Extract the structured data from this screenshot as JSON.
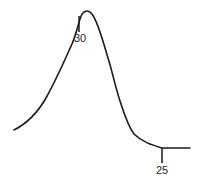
{
  "diagram": {
    "type": "curve-sketch",
    "stroke_color": "#1a1a1a",
    "curve": {
      "description": "Skewed bell-shaped curve with peak at left-center and long tail to the right",
      "path": "M14,130 C26,124 38,112 46,98 C56,80 64,62 72,44 C77,32 79,20 82,14 C85,10 89,10 92,14 C98,22 102,38 108,58 C113,74 116,90 121,104 C125,116 128,126 134,134 C142,142 152,145 162,148 C172,148 182,148 190,148"
    },
    "markers": [
      {
        "name": "peak-marker",
        "label": "30",
        "tick": {
          "x": 79,
          "y1": 16,
          "y2": 32
        },
        "label_pos": {
          "x": 80,
          "y": 42
        }
      },
      {
        "name": "tail-marker",
        "label": "25",
        "tick": {
          "x": 162,
          "y1": 148,
          "y2": 163
        },
        "label_pos": {
          "x": 162,
          "y": 174
        }
      }
    ]
  }
}
